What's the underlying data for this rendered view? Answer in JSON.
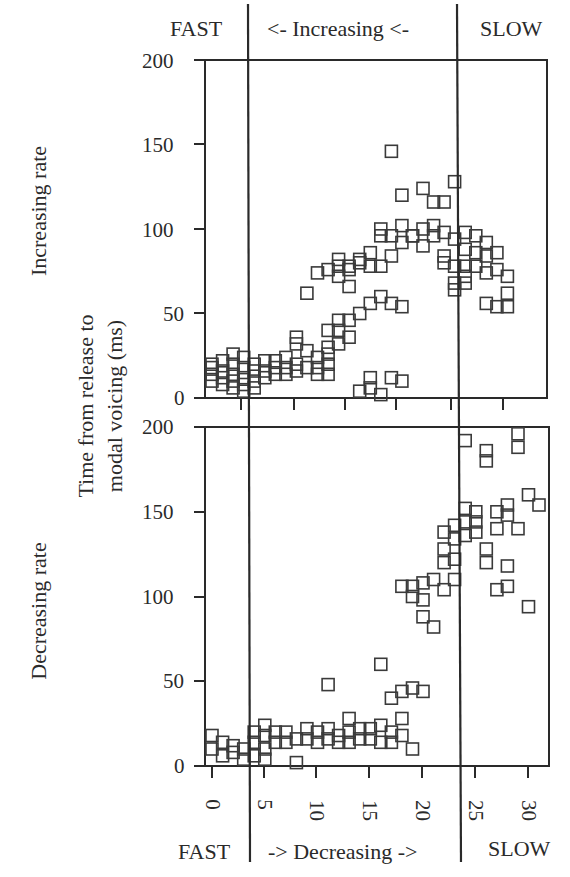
{
  "labels": {
    "top_fast": "FAST",
    "top_middle": "<- Increasing <-",
    "top_slow": "SLOW",
    "bottom_fast": "FAST",
    "bottom_middle": "-> Decreasing ->",
    "bottom_slow": "SLOW",
    "upper_panel_label": "Increasing rate",
    "lower_panel_label": "Decreasing rate",
    "ylabel_line1": "Time from release to",
    "ylabel_line2": "modal voicing (ms)"
  },
  "axes": {
    "upper_y_ticks": [
      "0",
      "50",
      "100",
      "150",
      "200"
    ],
    "lower_y_ticks": [
      "0",
      "50",
      "100",
      "150",
      "200"
    ],
    "lower_x_ticks": [
      "0",
      "5",
      "10",
      "15",
      "20",
      "25",
      "30"
    ]
  },
  "colors": {
    "ink": "#2a2a2a",
    "marker": "#3a3a3a",
    "background": "#ffffff"
  },
  "chart_data": [
    {
      "type": "scatter",
      "title": "Increasing rate",
      "xlabel": "",
      "ylabel": "Time from release to modal voicing (ms)",
      "xlim": [
        -0.7,
        32
      ],
      "ylim": [
        0,
        200
      ],
      "grid": false,
      "marker": "open-square",
      "region_labels": [
        "FAST",
        "<- Increasing <-",
        "SLOW"
      ],
      "region_boundaries_x": [
        3.4,
        23.5
      ],
      "points": [
        [
          0,
          18
        ],
        [
          0,
          14
        ],
        [
          0,
          10
        ],
        [
          0,
          20
        ],
        [
          1,
          16
        ],
        [
          1,
          12
        ],
        [
          1,
          8
        ],
        [
          1,
          22
        ],
        [
          2,
          20
        ],
        [
          2,
          14
        ],
        [
          2,
          10
        ],
        [
          2,
          6
        ],
        [
          2,
          26
        ],
        [
          3,
          24
        ],
        [
          3,
          18
        ],
        [
          3,
          12
        ],
        [
          3,
          8
        ],
        [
          3,
          4
        ],
        [
          4,
          20
        ],
        [
          4,
          16
        ],
        [
          4,
          10
        ],
        [
          4,
          6
        ],
        [
          5,
          22
        ],
        [
          5,
          16
        ],
        [
          5,
          12
        ],
        [
          6,
          22
        ],
        [
          6,
          18
        ],
        [
          6,
          14
        ],
        [
          7,
          24
        ],
        [
          7,
          18
        ],
        [
          7,
          14
        ],
        [
          8,
          20
        ],
        [
          8,
          16
        ],
        [
          8,
          32
        ],
        [
          9,
          28
        ],
        [
          9,
          18
        ],
        [
          10,
          24
        ],
        [
          10,
          18
        ],
        [
          10,
          14
        ],
        [
          11,
          26
        ],
        [
          11,
          20
        ],
        [
          11,
          14
        ],
        [
          8,
          36
        ],
        [
          9,
          62
        ],
        [
          10,
          74
        ],
        [
          11,
          76
        ],
        [
          12,
          82
        ],
        [
          12,
          78
        ],
        [
          12,
          72
        ],
        [
          13,
          78
        ],
        [
          13,
          76
        ],
        [
          13,
          66
        ],
        [
          12,
          46
        ],
        [
          12,
          40
        ],
        [
          13,
          46
        ],
        [
          14,
          80
        ],
        [
          14,
          82
        ],
        [
          15,
          78
        ],
        [
          16,
          78
        ],
        [
          16,
          96
        ],
        [
          16,
          100
        ],
        [
          15,
          86
        ],
        [
          11,
          40
        ],
        [
          11,
          30
        ],
        [
          14,
          50
        ],
        [
          15,
          56
        ],
        [
          13,
          36
        ],
        [
          12,
          32
        ],
        [
          17,
          84
        ],
        [
          17,
          96
        ],
        [
          18,
          92
        ],
        [
          18,
          102
        ],
        [
          19,
          96
        ],
        [
          19,
          96
        ],
        [
          20,
          100
        ],
        [
          20,
          90
        ],
        [
          21,
          96
        ],
        [
          21,
          102
        ],
        [
          22,
          98
        ],
        [
          22,
          84
        ],
        [
          22,
          80
        ],
        [
          23,
          78
        ],
        [
          23,
          94
        ],
        [
          23,
          68
        ],
        [
          23,
          64
        ],
        [
          18,
          120
        ],
        [
          17,
          146
        ],
        [
          20,
          124
        ],
        [
          21,
          116
        ],
        [
          22,
          116
        ],
        [
          23,
          128
        ],
        [
          16,
          60
        ],
        [
          17,
          56
        ],
        [
          18,
          54
        ],
        [
          14,
          4
        ],
        [
          15,
          12
        ],
        [
          15,
          6
        ],
        [
          16,
          2
        ],
        [
          17,
          12
        ],
        [
          18,
          10
        ],
        [
          24,
          98
        ],
        [
          24,
          88
        ],
        [
          24,
          78
        ],
        [
          25,
          96
        ],
        [
          25,
          86
        ],
        [
          25,
          78
        ],
        [
          26,
          92
        ],
        [
          26,
          84
        ],
        [
          26,
          74
        ],
        [
          26,
          56
        ],
        [
          27,
          86
        ],
        [
          27,
          76
        ],
        [
          27,
          54
        ],
        [
          28,
          72
        ],
        [
          28,
          62
        ],
        [
          28,
          54
        ],
        [
          24,
          68
        ],
        [
          24,
          72
        ]
      ]
    },
    {
      "type": "scatter",
      "title": "Decreasing rate",
      "xlabel": "",
      "ylabel": "Time from release to modal voicing (ms)",
      "xlim": [
        -0.7,
        32
      ],
      "ylim": [
        0,
        200
      ],
      "x_ticks": [
        0,
        5,
        10,
        15,
        20,
        25,
        30
      ],
      "grid": false,
      "marker": "open-square",
      "region_labels": [
        "FAST",
        "-> Decreasing ->",
        "SLOW"
      ],
      "region_boundaries_x": [
        3.4,
        23.6
      ],
      "points": [
        [
          0,
          18
        ],
        [
          0,
          10
        ],
        [
          1,
          14
        ],
        [
          1,
          6
        ],
        [
          2,
          12
        ],
        [
          2,
          8
        ],
        [
          3,
          10
        ],
        [
          3,
          4
        ],
        [
          4,
          20
        ],
        [
          4,
          14
        ],
        [
          4,
          6
        ],
        [
          5,
          24
        ],
        [
          5,
          18
        ],
        [
          5,
          10
        ],
        [
          5,
          4
        ],
        [
          6,
          20
        ],
        [
          6,
          14
        ],
        [
          7,
          20
        ],
        [
          7,
          14
        ],
        [
          8,
          16
        ],
        [
          8,
          2
        ],
        [
          9,
          22
        ],
        [
          9,
          16
        ],
        [
          10,
          20
        ],
        [
          10,
          14
        ],
        [
          11,
          22
        ],
        [
          11,
          16
        ],
        [
          12,
          18
        ],
        [
          12,
          14
        ],
        [
          13,
          28
        ],
        [
          13,
          20
        ],
        [
          13,
          14
        ],
        [
          14,
          22
        ],
        [
          14,
          16
        ],
        [
          15,
          22
        ],
        [
          15,
          16
        ],
        [
          16,
          24
        ],
        [
          16,
          14
        ],
        [
          17,
          20
        ],
        [
          17,
          14
        ],
        [
          18,
          28
        ],
        [
          18,
          18
        ],
        [
          19,
          10
        ],
        [
          11,
          48
        ],
        [
          16,
          60
        ],
        [
          17,
          40
        ],
        [
          18,
          44
        ],
        [
          19,
          46
        ],
        [
          20,
          44
        ],
        [
          18,
          106
        ],
        [
          19,
          106
        ],
        [
          19,
          100
        ],
        [
          20,
          98
        ],
        [
          20,
          88
        ],
        [
          20,
          108
        ],
        [
          21,
          82
        ],
        [
          21,
          110
        ],
        [
          22,
          104
        ],
        [
          22,
          120
        ],
        [
          22,
          128
        ],
        [
          22,
          138
        ],
        [
          23,
          110
        ],
        [
          23,
          122
        ],
        [
          23,
          134
        ],
        [
          23,
          142
        ],
        [
          24,
          192
        ],
        [
          24,
          152
        ],
        [
          24,
          144
        ],
        [
          24,
          136
        ],
        [
          25,
          150
        ],
        [
          25,
          144
        ],
        [
          25,
          138
        ],
        [
          26,
          180
        ],
        [
          26,
          186
        ],
        [
          26,
          120
        ],
        [
          26,
          128
        ],
        [
          27,
          104
        ],
        [
          27,
          140
        ],
        [
          27,
          150
        ],
        [
          28,
          148
        ],
        [
          28,
          154
        ],
        [
          28,
          118
        ],
        [
          28,
          106
        ],
        [
          29,
          196
        ],
        [
          29,
          188
        ],
        [
          29,
          140
        ],
        [
          30,
          160
        ],
        [
          30,
          94
        ],
        [
          31,
          154
        ]
      ]
    }
  ]
}
